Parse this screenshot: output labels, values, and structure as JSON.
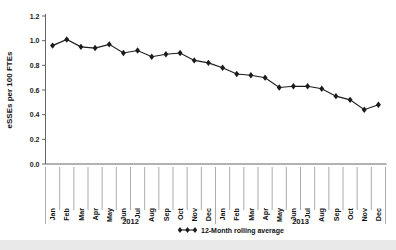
{
  "chart_data": {
    "type": "line",
    "title": "",
    "xlabel": "",
    "ylabel": "eSSEs per 100 FTEs",
    "ylim": [
      0.0,
      1.2
    ],
    "ytick_labels": [
      "0.0",
      "0.2",
      "0.4",
      "0.6",
      "0.8",
      "1.0",
      "1.2"
    ],
    "ytick_values": [
      0.0,
      0.2,
      0.4,
      0.6,
      0.8,
      1.0,
      1.2
    ],
    "grid": false,
    "legend_position": "bottom-right",
    "categories": [
      "Jan",
      "Feb",
      "Mar",
      "Apr",
      "May",
      "Jun",
      "Jul",
      "Aug",
      "Sep",
      "Oct",
      "Nov",
      "Dec",
      "Jan",
      "Feb",
      "Mar",
      "Apr",
      "May",
      "Jun",
      "Jul",
      "Aug",
      "Sep",
      "Oct",
      "Nov",
      "Dec"
    ],
    "group_labels": [
      "2012",
      "2013"
    ],
    "series": [
      {
        "name": "12-Month rolling average",
        "marker": "diamond",
        "color": "#1c1c1c",
        "values": [
          0.96,
          1.01,
          0.95,
          0.94,
          0.97,
          0.9,
          0.92,
          0.87,
          0.89,
          0.9,
          0.84,
          0.82,
          0.78,
          0.73,
          0.72,
          0.7,
          0.62,
          0.63,
          0.63,
          0.61,
          0.55,
          0.52,
          0.44,
          0.48
        ]
      }
    ]
  },
  "legend": {
    "entries": [
      {
        "label": "12-Month rolling average",
        "marker": "diamond-marker",
        "color": "#1c1c1c"
      }
    ]
  },
  "axes": {
    "y_title": "eSSEs per 100 FTEs"
  }
}
